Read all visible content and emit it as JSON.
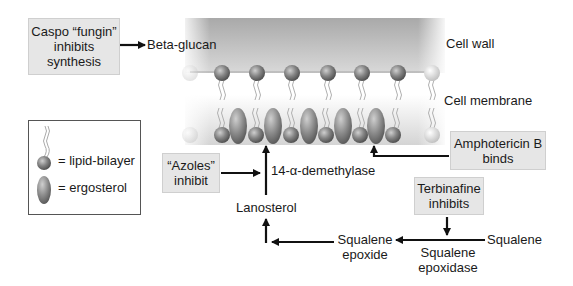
{
  "diagram": {
    "regions": {
      "cell_wall": "Cell wall",
      "cell_membrane": "Cell membrane"
    },
    "drug_boxes": {
      "caspofungin": {
        "line1": "Caspo “fungin”",
        "line2": "inhibits",
        "line3": "synthesis"
      },
      "azoles": {
        "line1": "“Azoles”",
        "line2": "inhibit"
      },
      "amphotericin": {
        "line1": "Amphotericin B",
        "line2": "binds"
      },
      "terbinafine": {
        "line1": "Terbinafine",
        "line2": "inhibits"
      }
    },
    "pathway": {
      "beta_glucan": "Beta-glucan",
      "enzyme_demethylase": "14-α-demethylase",
      "lanosterol": "Lanosterol",
      "squalene_epoxide": {
        "line1": "Squalene",
        "line2": "epoxide"
      },
      "squalene": "Squalene",
      "enzyme_epoxidase": {
        "line1": "Squalene",
        "line2": "epoxidase"
      }
    },
    "legend": {
      "lipid": "= lipid-bilayer",
      "ergosterol": "= ergosterol"
    },
    "colors": {
      "box_fill": "#e6e6e6",
      "wall_gray": "#b5b5b5",
      "head_dark": "#6f6f6f",
      "head_light": "#d8d8d8",
      "arrow": "#111111"
    }
  }
}
